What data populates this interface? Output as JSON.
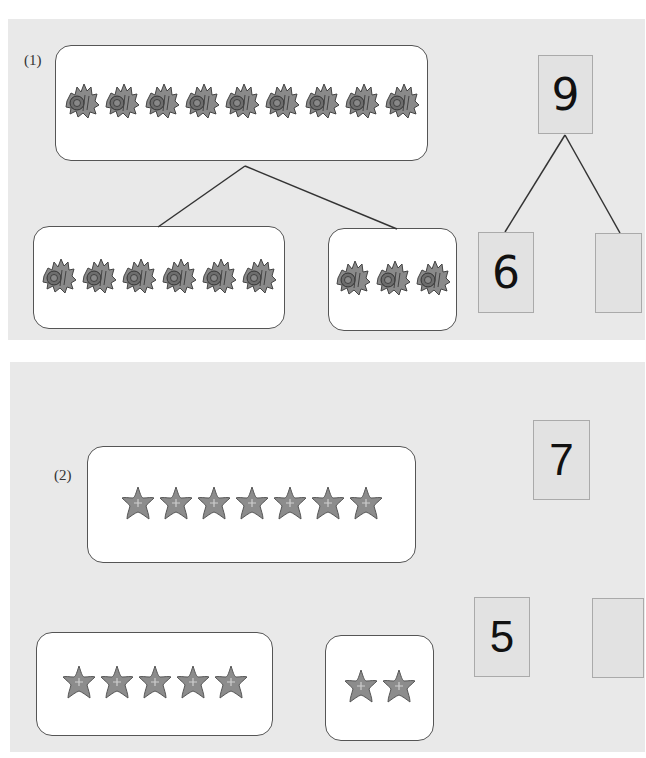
{
  "problems": [
    {
      "label": "(1)",
      "item_icon": "shell-icon",
      "total_count": 9,
      "left_count": 6,
      "right_count": 3,
      "tree": {
        "top": "9",
        "left": "6",
        "right": ""
      }
    },
    {
      "label": "(2)",
      "item_icon": "starfish-icon",
      "total_count": 7,
      "left_count": 5,
      "right_count": 2,
      "tree": {
        "top": "7",
        "left": "5",
        "right": ""
      }
    }
  ],
  "colors": {
    "panel_bg": "#e9e9e9",
    "box_border": "#555555",
    "icon_gray": "#8a8a8a"
  }
}
